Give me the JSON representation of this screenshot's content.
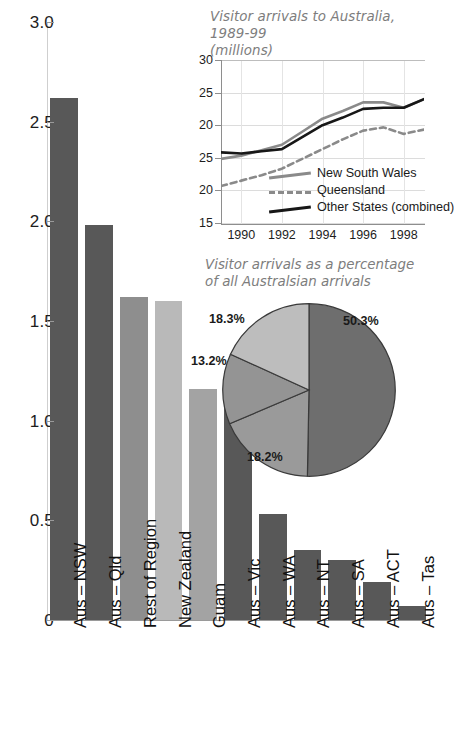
{
  "chart_data": [
    {
      "type": "bar",
      "title": "",
      "xlabel": "",
      "ylabel": "",
      "ylim": [
        0,
        3.0
      ],
      "yticks": [
        "0",
        "0.5",
        "1.0",
        "1.5",
        "2.0",
        "2.5",
        "3.0"
      ],
      "ytick_values": [
        0,
        0.5,
        1.0,
        1.5,
        2.0,
        2.5,
        3.0
      ],
      "grid": false,
      "categories": [
        "Aus – NSW",
        "Aus – Qld",
        "Rest of Region",
        "New Zealand",
        "Guam",
        "Aus – Vic",
        "Aus – WA",
        "Aus – NT",
        "Aus – SA",
        "Aus – ACT",
        "Aus – Tas"
      ],
      "values": [
        2.62,
        1.98,
        1.62,
        1.6,
        1.16,
        1.11,
        0.53,
        0.35,
        0.3,
        0.19,
        0.07
      ],
      "bar_colors": [
        "#585858",
        "#585858",
        "#8e8e8e",
        "#b9b9b9",
        "#a3a3a3",
        "#585858",
        "#585858",
        "#585858",
        "#585858",
        "#585858",
        "#585858"
      ]
    },
    {
      "type": "line",
      "title": "Visitor arrivals to Australia, 1989-99 (millions)",
      "title_line1": "Visitor arrivals to Australia, 1989-99",
      "title_line2": "(millions)",
      "xlabel": "",
      "ylabel": "",
      "ylim": [
        15,
        30
      ],
      "yticks": [
        "30",
        "25",
        "20",
        "25",
        "20",
        "15"
      ],
      "ytick_positions": [
        30,
        27,
        24,
        21,
        18,
        15
      ],
      "xticks": [
        "1990",
        "1992",
        "1994",
        "1996",
        "1998"
      ],
      "xtick_values": [
        1990,
        1992,
        1994,
        1996,
        1998
      ],
      "xlim": [
        1989,
        1999
      ],
      "grid": true,
      "legend_position": "inside-bottom-right",
      "x": [
        1989,
        1990,
        1991,
        1992,
        1993,
        1994,
        1995,
        1996,
        1997,
        1998,
        1999
      ],
      "series": [
        {
          "name": "New South Wales",
          "style": "solid",
          "color": "#8a8a8a",
          "values": [
            20.9,
            21.2,
            21.7,
            22.2,
            23.4,
            24.6,
            25.3,
            26.1,
            26.1,
            25.6,
            26.4
          ]
        },
        {
          "name": "Queensland",
          "style": "dashed",
          "color": "#8a8a8a",
          "values": [
            18.4,
            18.9,
            19.4,
            20.0,
            20.9,
            21.8,
            22.7,
            23.5,
            23.8,
            23.2,
            23.6
          ]
        },
        {
          "name": "Other States (combined)",
          "style": "solid",
          "color": "#171717",
          "values": [
            21.5,
            21.4,
            21.6,
            21.8,
            22.9,
            24.0,
            24.7,
            25.5,
            25.6,
            25.6,
            26.4
          ]
        }
      ]
    },
    {
      "type": "pie",
      "title": "Visitor arrivals as a percentage of all Australsian arrivals",
      "title_line1": "Visitor arrivals as a percentage",
      "title_line2": "of all Australsian arrivals",
      "labels": [
        "50.3%",
        "18.3%",
        "13.2%",
        "18.2%"
      ],
      "values": [
        50.3,
        18.3,
        13.2,
        18.2
      ],
      "colors": [
        "#6e6e6e",
        "#9a9a9a",
        "#949494",
        "#bdbdbd"
      ]
    }
  ],
  "bar_chart": {
    "yticks": [
      {
        "label": "3.0",
        "value": 3.0
      },
      {
        "label": "2.5",
        "value": 2.5
      },
      {
        "label": "2.0",
        "value": 2.0
      },
      {
        "label": "1.5",
        "value": 1.5
      },
      {
        "label": "1.0",
        "value": 1.0
      },
      {
        "label": "0.5",
        "value": 0.5
      },
      {
        "label": "0",
        "value": 0
      }
    ],
    "bars": [
      {
        "label": "Aus – NSW",
        "value": 2.62,
        "color": "#585858"
      },
      {
        "label": "Aus – Qld",
        "value": 1.98,
        "color": "#585858"
      },
      {
        "label": "Rest of Region",
        "value": 1.62,
        "color": "#8e8e8e"
      },
      {
        "label": "New Zealand",
        "value": 1.6,
        "color": "#b9b9b9"
      },
      {
        "label": "Guam",
        "value": 1.16,
        "color": "#a3a3a3"
      },
      {
        "label": "Aus – Vic",
        "value": 1.11,
        "color": "#585858"
      },
      {
        "label": "Aus – WA",
        "value": 0.53,
        "color": "#585858"
      },
      {
        "label": "Aus – NT",
        "value": 0.35,
        "color": "#585858"
      },
      {
        "label": "Aus – SA",
        "value": 0.3,
        "color": "#585858"
      },
      {
        "label": "Aus – ACT",
        "value": 0.19,
        "color": "#585858"
      },
      {
        "label": "Aus – Tas",
        "value": 0.07,
        "color": "#585858"
      }
    ]
  },
  "line_inset": {
    "title_line1": "Visitor arrivals to Australia, 1989-99",
    "title_line2": "(millions)",
    "yticks": [
      "30",
      "25",
      "20",
      "25",
      "20",
      "15"
    ],
    "xticks": [
      "1990",
      "1992",
      "1994",
      "1996",
      "1998"
    ],
    "legend": [
      {
        "name": "New South Wales",
        "style": "solid",
        "color": "#8a8a8a"
      },
      {
        "name": "Queensland",
        "style": "dashed",
        "color": "#8a8a8a"
      },
      {
        "name": "Other States (combined)",
        "style": "solid",
        "color": "#171717"
      }
    ]
  },
  "pie_inset": {
    "title_line1": "Visitor arrivals as a percentage",
    "title_line2": "of all Australsian arrivals",
    "slices": [
      {
        "label": "50.3%",
        "value": 50.3,
        "color": "#6e6e6e"
      },
      {
        "label": "18.3%",
        "value": 18.3,
        "color": "#9a9a9a"
      },
      {
        "label": "13.2%",
        "value": 13.2,
        "color": "#949494"
      },
      {
        "label": "18.2%",
        "value": 18.2,
        "color": "#bdbdbd"
      }
    ]
  }
}
